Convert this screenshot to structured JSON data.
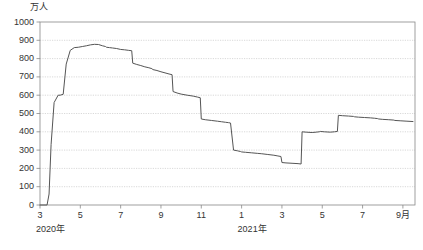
{
  "chart_data": {
    "type": "line",
    "title": "",
    "subtitle": "",
    "xlabel": "",
    "ylabel": "万人",
    "unit_label": "万人",
    "ylim": [
      0,
      1000
    ],
    "ytick_step": 100,
    "yticks": [
      "1000",
      "900",
      "800",
      "700",
      "600",
      "500",
      "400",
      "300",
      "200",
      "100",
      "0"
    ],
    "ytick_values": [
      1000,
      900,
      800,
      700,
      600,
      500,
      400,
      300,
      200,
      100,
      0
    ],
    "xticks": [
      "3",
      "5",
      "7",
      "9",
      "11",
      "1",
      "3",
      "5",
      "7",
      "9月"
    ],
    "xtick_values": [
      3,
      5,
      7,
      9,
      11,
      13,
      15,
      17,
      19,
      21
    ],
    "xlim": [
      3,
      21.6
    ],
    "year_labels": [
      {
        "text": "2020年",
        "at": 3
      },
      {
        "text": "2021年",
        "at": 13
      }
    ],
    "grid": true,
    "grid_style": "dotted-horizontal",
    "legend": "none",
    "legend_position": "none",
    "line_color": "#555555",
    "grid_color": "#c8c8c8",
    "axis_color": "#888888",
    "background_color": "#ffffff",
    "x": [
      3.0,
      3.35,
      3.45,
      3.55,
      3.7,
      3.9,
      4.0,
      4.15,
      4.3,
      4.5,
      4.7,
      4.9,
      5.1,
      5.3,
      5.5,
      5.7,
      5.9,
      6.1,
      6.25,
      6.3,
      6.45,
      6.6,
      6.8,
      7.0,
      7.2,
      7.4,
      7.55,
      7.6,
      7.8,
      8.0,
      8.2,
      8.4,
      8.55,
      8.6,
      8.8,
      9.0,
      9.2,
      9.4,
      9.55,
      9.6,
      9.8,
      10.0,
      10.3,
      10.6,
      10.8,
      10.95,
      11.0,
      11.2,
      11.5,
      11.8,
      12.0,
      12.2,
      12.35,
      12.45,
      12.6,
      12.8,
      12.95,
      13.0,
      13.2,
      13.5,
      13.8,
      14.0,
      14.3,
      14.6,
      14.8,
      14.95,
      15.0,
      15.2,
      15.5,
      15.8,
      15.95,
      16.0,
      16.2,
      16.5,
      16.7,
      16.85,
      16.9,
      17.1,
      17.4,
      17.6,
      17.75,
      17.8,
      18.0,
      18.3,
      18.55,
      18.6,
      18.8,
      19.1,
      19.4,
      19.6,
      19.75,
      19.8,
      20.0,
      20.3,
      20.55,
      20.6,
      20.9,
      21.2,
      21.5
    ],
    "y": [
      0,
      0,
      60,
      330,
      560,
      600,
      600,
      605,
      770,
      845,
      860,
      862,
      866,
      870,
      875,
      878,
      877,
      870,
      866,
      862,
      860,
      858,
      855,
      850,
      848,
      845,
      843,
      775,
      768,
      762,
      755,
      750,
      745,
      740,
      735,
      728,
      722,
      716,
      712,
      620,
      612,
      606,
      600,
      595,
      590,
      586,
      470,
      466,
      462,
      458,
      455,
      452,
      450,
      448,
      300,
      296,
      292,
      290,
      288,
      285,
      282,
      280,
      276,
      272,
      268,
      265,
      232,
      230,
      228,
      226,
      224,
      400,
      398,
      396,
      398,
      400,
      402,
      400,
      398,
      400,
      402,
      490,
      488,
      486,
      484,
      482,
      480,
      478,
      476,
      474,
      472,
      470,
      468,
      466,
      464,
      462,
      460,
      458,
      456
    ],
    "series_note": "Number of employees on temporary leave (休業者数), Japan, Mar 2020 - Sep 2021",
    "data_points": [
      {
        "label": "2020-03",
        "value": 0
      },
      {
        "label": "2020-04",
        "value": 600
      },
      {
        "label": "2020-05",
        "value": 875
      },
      {
        "label": "2020-06",
        "value": 855
      },
      {
        "label": "2020-07",
        "value": 760
      },
      {
        "label": "2020-08",
        "value": 720
      },
      {
        "label": "2020-09",
        "value": 610
      },
      {
        "label": "2020-10",
        "value": 460
      },
      {
        "label": "2020-11",
        "value": 290
      },
      {
        "label": "2020-12",
        "value": 270
      },
      {
        "label": "2021-01",
        "value": 400
      },
      {
        "label": "2021-02",
        "value": 490
      },
      {
        "label": "2021-03",
        "value": 480
      },
      {
        "label": "2021-04",
        "value": 420
      },
      {
        "label": "2021-05",
        "value": 330
      },
      {
        "label": "2021-06",
        "value": 250
      },
      {
        "label": "2021-07",
        "value": 180
      },
      {
        "label": "2021-08",
        "value": 140
      },
      {
        "label": "2021-09",
        "value": 100
      }
    ]
  }
}
